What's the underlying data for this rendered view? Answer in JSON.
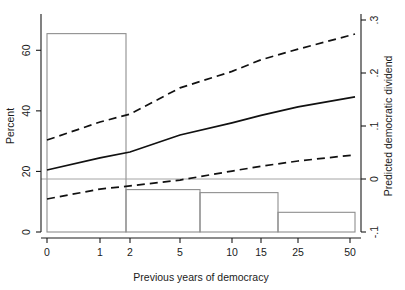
{
  "chart_data": {
    "type": "line",
    "title": "",
    "xlabel": "Previous years of democracy",
    "ylabel": "Percent",
    "y2label": "Predicted democratic dividend",
    "grid": false,
    "legend": "none",
    "x_scale": "ordinal-compressed",
    "x_ticks": [
      {
        "label": "0",
        "value": 0,
        "px": 47
      },
      {
        "label": "1",
        "value": 1,
        "px": 100
      },
      {
        "label": "2",
        "value": 2,
        "px": 130
      },
      {
        "label": "5",
        "value": 5,
        "px": 180
      },
      {
        "label": "10",
        "value": 10,
        "px": 232
      },
      {
        "label": "15",
        "value": 15,
        "px": 261
      },
      {
        "label": "25",
        "value": 25,
        "px": 298
      },
      {
        "label": "50",
        "value": 50,
        "px": 350
      }
    ],
    "ylim": [
      0,
      70
    ],
    "y_ticks": [
      {
        "label": "0",
        "value": 0
      },
      {
        "label": "20",
        "value": 20
      },
      {
        "label": "40",
        "value": 40
      },
      {
        "label": "60",
        "value": 60
      }
    ],
    "y2lim": [
      -0.1,
      0.3
    ],
    "y2_ticks": [
      {
        "label": "-.1",
        "value": -0.1
      },
      {
        "label": "0",
        "value": 0
      },
      {
        "label": ".1",
        "value": 0.1
      },
      {
        "label": ".2",
        "value": 0.2
      },
      {
        "label": ".3",
        "value": 0.3
      }
    ],
    "zero_reference_line": {
      "axis": "right",
      "value": 0,
      "style": "thin-solid-gray"
    },
    "histogram": {
      "name": "Percent of observations",
      "axis": "left",
      "bars": [
        {
          "x_start": 0,
          "x_end": 1.8,
          "px_start": 47,
          "px_end": 126,
          "percent": 65.5
        },
        {
          "x_start": 1.8,
          "x_end": 6.5,
          "px_start": 126,
          "px_end": 200,
          "percent": 14.0
        },
        {
          "x_start": 6.5,
          "x_end": 20,
          "px_start": 200,
          "px_end": 278,
          "percent": 13.0
        },
        {
          "x_start": 20,
          "x_end": 52,
          "px_start": 278,
          "px_end": 355,
          "percent": 6.5
        }
      ]
    },
    "series": [
      {
        "name": "Upper 95% confidence bound",
        "axis": "right",
        "style": "dashed",
        "points": [
          {
            "px": 47,
            "value": 0.0735
          },
          {
            "px": 100,
            "value": 0.1075
          },
          {
            "px": 130,
            "value": 0.1225
          },
          {
            "px": 180,
            "value": 0.172
          },
          {
            "px": 232,
            "value": 0.203
          },
          {
            "px": 261,
            "value": 0.225
          },
          {
            "px": 298,
            "value": 0.245
          },
          {
            "px": 355,
            "value": 0.2735
          }
        ]
      },
      {
        "name": "Predicted democratic dividend",
        "axis": "right",
        "style": "solid",
        "points": [
          {
            "px": 47,
            "value": 0.017
          },
          {
            "px": 100,
            "value": 0.04
          },
          {
            "px": 130,
            "value": 0.051
          },
          {
            "px": 180,
            "value": 0.083
          },
          {
            "px": 232,
            "value": 0.106
          },
          {
            "px": 261,
            "value": 0.12
          },
          {
            "px": 298,
            "value": 0.136
          },
          {
            "px": 355,
            "value": 0.155
          }
        ]
      },
      {
        "name": "Lower 95% confidence bound",
        "axis": "right",
        "style": "dashed",
        "points": [
          {
            "px": 47,
            "value": -0.0377
          },
          {
            "px": 100,
            "value": -0.019
          },
          {
            "px": 130,
            "value": -0.013
          },
          {
            "px": 180,
            "value": -0.002
          },
          {
            "px": 232,
            "value": 0.015
          },
          {
            "px": 261,
            "value": 0.024
          },
          {
            "px": 298,
            "value": 0.034
          },
          {
            "px": 355,
            "value": 0.0455
          }
        ]
      }
    ]
  },
  "axes": {
    "left_title": "Percent",
    "bottom_title": "Previous years of democracy",
    "right_title": "Predicted democratic dividend"
  }
}
